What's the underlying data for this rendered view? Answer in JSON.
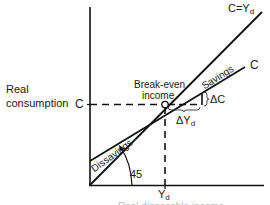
{
  "diagram": {
    "type": "consumption-function",
    "y_axis_label_line1": "Real",
    "y_axis_label_line2": "consumption",
    "x_axis_label": "Real disposable income",
    "c_tick_label": "C",
    "yd_tick_label": "Y",
    "yd_tick_sub": "d",
    "line_45_label": "C=Y",
    "line_45_sub": "d",
    "consumption_line_label": "C",
    "breakeven_label_line1": "Break-even",
    "breakeven_label_line2": "income",
    "savings_label": "Savings",
    "dissavings_label": "Dissavings",
    "delta_c_label": "ΔC",
    "delta_yd_label": "ΔY",
    "delta_yd_sub": "d",
    "angle_label": "45",
    "colors": {
      "line": "#111111",
      "text": "#1a1a1a",
      "background": "#ffffff"
    }
  }
}
